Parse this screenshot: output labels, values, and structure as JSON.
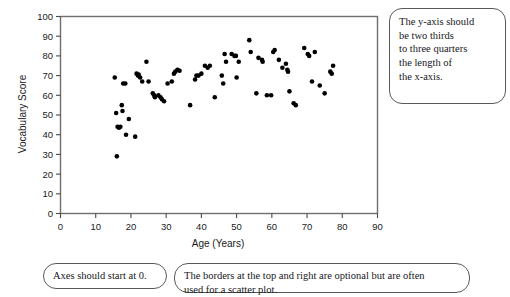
{
  "chart_data": {
    "type": "scatter",
    "title": "",
    "xlabel": "Age (Years)",
    "ylabel": "Vocabulary Score",
    "xlim": [
      0,
      90
    ],
    "ylim": [
      0,
      100
    ],
    "xticks": [
      0,
      10,
      20,
      30,
      40,
      50,
      60,
      70,
      80,
      90
    ],
    "yticks": [
      0,
      10,
      20,
      30,
      40,
      50,
      60,
      70,
      80,
      90,
      100
    ],
    "grid": false,
    "legend": false,
    "marker": {
      "shape": "circle",
      "color": "#000000",
      "size": 4.4
    },
    "border": {
      "top": true,
      "right": true,
      "bottom": true,
      "left": true,
      "color": "#6e6e6e"
    },
    "points": [
      [
        15.4,
        69
      ],
      [
        15.8,
        51
      ],
      [
        16.0,
        29
      ],
      [
        16.2,
        44
      ],
      [
        16.6,
        43.5
      ],
      [
        17.0,
        44
      ],
      [
        17.4,
        55
      ],
      [
        17.6,
        52
      ],
      [
        17.8,
        66
      ],
      [
        18.4,
        66
      ],
      [
        18.6,
        40
      ],
      [
        19.4,
        48
      ],
      [
        21.2,
        39
      ],
      [
        21.6,
        71
      ],
      [
        22.0,
        70
      ],
      [
        22.2,
        70.5
      ],
      [
        22.6,
        69
      ],
      [
        23.2,
        67
      ],
      [
        24.4,
        77
      ],
      [
        25.0,
        67
      ],
      [
        26.2,
        61
      ],
      [
        26.6,
        60
      ],
      [
        26.8,
        59
      ],
      [
        27.8,
        60
      ],
      [
        28.4,
        59
      ],
      [
        28.8,
        58
      ],
      [
        29.4,
        57
      ],
      [
        30.4,
        66
      ],
      [
        31.6,
        67
      ],
      [
        32.2,
        71
      ],
      [
        32.6,
        72
      ],
      [
        33.2,
        73
      ],
      [
        33.8,
        72.5
      ],
      [
        36.8,
        55
      ],
      [
        38.2,
        68
      ],
      [
        38.6,
        70
      ],
      [
        39.2,
        70
      ],
      [
        40.0,
        71
      ],
      [
        41.0,
        75
      ],
      [
        41.8,
        74
      ],
      [
        42.4,
        75
      ],
      [
        43.8,
        59
      ],
      [
        45.8,
        70
      ],
      [
        46.2,
        66
      ],
      [
        46.6,
        81
      ],
      [
        47.0,
        77
      ],
      [
        48.6,
        81
      ],
      [
        49.4,
        80
      ],
      [
        49.8,
        80
      ],
      [
        50.0,
        69
      ],
      [
        50.6,
        77
      ],
      [
        53.6,
        88
      ],
      [
        54.0,
        82
      ],
      [
        55.6,
        61
      ],
      [
        56.2,
        79
      ],
      [
        57.2,
        78
      ],
      [
        57.4,
        77
      ],
      [
        58.6,
        60
      ],
      [
        59.8,
        60
      ],
      [
        60.4,
        82
      ],
      [
        60.8,
        83
      ],
      [
        62.0,
        78
      ],
      [
        63.0,
        74
      ],
      [
        64.0,
        76
      ],
      [
        64.4,
        73
      ],
      [
        64.6,
        72
      ],
      [
        65.0,
        62
      ],
      [
        66.2,
        56
      ],
      [
        66.8,
        55
      ],
      [
        69.2,
        84
      ],
      [
        70.2,
        81
      ],
      [
        70.6,
        80
      ],
      [
        71.4,
        67
      ],
      [
        72.2,
        82
      ],
      [
        73.6,
        65
      ],
      [
        75.0,
        61
      ],
      [
        76.6,
        72
      ],
      [
        77.0,
        71
      ],
      [
        77.4,
        75
      ]
    ]
  },
  "callouts": {
    "y_axis_note": [
      "The y-axis should",
      "be two thirds",
      "to three quarters",
      "the length of",
      "the x-axis."
    ],
    "origin_note": "Axes should start at 0.",
    "borders_note": [
      "The borders at the top and right are optional but are often",
      "used for a scatter plot."
    ]
  }
}
